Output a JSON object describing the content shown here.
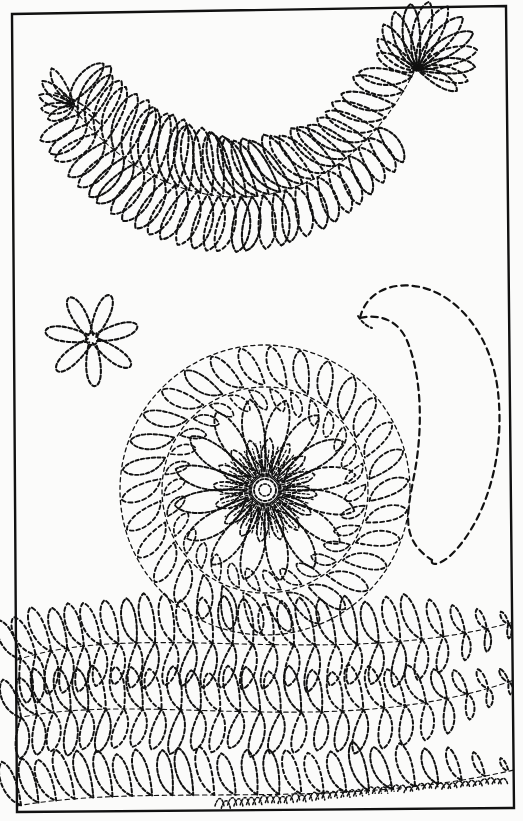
{
  "document": {
    "title": "Quilting Pattern Sheet",
    "media": "scanned book page",
    "page_background": "#fbfbfa",
    "ink_color": "#111111",
    "line_style": "dashed stitch line",
    "border": {
      "name": "page-frame",
      "stroke": "#111111",
      "stroke_width": 2.4,
      "corners": {
        "top_left": [
          12,
          14
        ],
        "top_right": [
          506,
          6
        ],
        "bottom_right": [
          514,
          808
        ],
        "bottom_left": [
          17,
          812
        ]
      }
    }
  },
  "motifs": [
    {
      "id": "feather-plume-large",
      "label": "Large curved feather plume",
      "position": [
        55,
        35,
        465,
        265
      ],
      "plume_count": 34,
      "description": "Long S-curved feather spray with teardrop plumes along a central spine, fanning head at upper right and tapering tail at left"
    },
    {
      "id": "pinwheel-rosette",
      "label": "Small pinwheel rosette",
      "center": [
        92,
        339
      ],
      "radius": 58,
      "petal_count": 7,
      "description": "Spiral pinwheel of seven curved petals radiating from a small hub"
    },
    {
      "id": "crescent-paisley",
      "label": "Large crescent paisley",
      "position": [
        352,
        282,
        500,
        565
      ],
      "description": "Open comma / paisley outline formed by two long dashed curves meeting at a point"
    },
    {
      "id": "feather-wreath-medallion",
      "label": "Circular feather wreath medallion",
      "center": [
        265,
        490
      ],
      "outer_radius": 145,
      "wreath_inner_radius": 103,
      "wreath_plume_count": 30,
      "flower": {
        "petal_count": 16,
        "petal_outer_radius": 92,
        "inner_petal_count": 16,
        "inner_petal_radius": 52,
        "hub_radius": 11,
        "ray_count": 64
      },
      "description": "Round wreath of feather plumes enclosing a many-petalled daisy with radiating stitch rays and a small circular hub"
    },
    {
      "id": "feather-border-band-1",
      "label": "Upper feather border band",
      "position": [
        17,
        618,
        514,
        712
      ],
      "plume_count": 26,
      "description": "Double-sided feather border running left to right with plumes above and below a gently waving spine"
    },
    {
      "id": "feather-border-band-2",
      "label": "Middle feather border band",
      "position": [
        17,
        660,
        514,
        760
      ],
      "plume_count": 26,
      "description": "Second double-sided feather border, offset and waving in counterpoint to the first"
    },
    {
      "id": "feather-border-band-3",
      "label": "Lower feather border band",
      "position": [
        17,
        730,
        514,
        810
      ],
      "plume_count": 24,
      "description": "Bottom feather border with plumes rising from the page edge, condensing into fine stitches at the right"
    }
  ]
}
